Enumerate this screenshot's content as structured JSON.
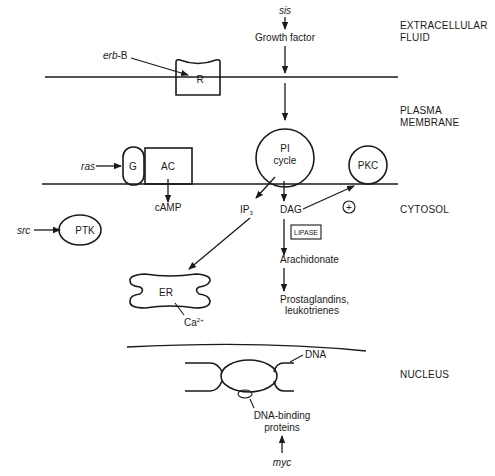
{
  "regions": {
    "extracellular_line1": "EXTRACELLULAR",
    "extracellular_line2": "FLUID",
    "plasma_line1": "PLASMA",
    "plasma_line2": "MEMBRANE",
    "cytosol": "CYTOSOL",
    "nucleus": "NUCLEUS"
  },
  "oncogenes": {
    "sis": "sis",
    "erb_b_italic": "erb",
    "erb_b_suffix": "-B",
    "ras": "ras",
    "src": "src",
    "myc": "myc"
  },
  "components": {
    "growth_factor": "Growth factor",
    "receptor": "R",
    "g_protein": "G",
    "adenylate_cyclase": "AC",
    "camp": "cAMP",
    "pi_cycle_line1": "PI",
    "pi_cycle_line2": "cycle",
    "pkc": "PKC",
    "ip3": "IP",
    "ip3_sub": "3",
    "dag": "DAG",
    "plus": "+",
    "lipase": "LIPASE",
    "arachidonate": "Arachidonate",
    "prostaglandins_line1": "Prostaglandins,",
    "prostaglandins_line2": "leukotrienes",
    "ptk": "PTK",
    "er": "ER",
    "calcium": "Ca",
    "calcium_sup": "2+",
    "dna": "DNA",
    "dna_binding_line1": "DNA-binding",
    "dna_binding_line2": "proteins"
  }
}
